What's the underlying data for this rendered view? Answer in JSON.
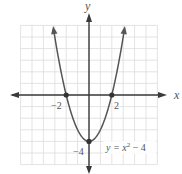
{
  "chart_data": {
    "type": "line",
    "title": "",
    "equation_label": "y = x² − 4",
    "equation_parts": {
      "lhs": "y = x",
      "exp": "2",
      "rhs": " − 4"
    },
    "xlabel": "x",
    "ylabel": "y",
    "xlim": [
      -6,
      6
    ],
    "ylim": [
      -6,
      6
    ],
    "grid": true,
    "grid_step": 1,
    "series": [
      {
        "name": "y = x^2 - 4",
        "function": "x^2 - 4",
        "x": [
          -3.16,
          -3,
          -2.5,
          -2,
          -1.5,
          -1,
          -0.5,
          0,
          0.5,
          1,
          1.5,
          2,
          2.5,
          3,
          3.16
        ],
        "y": [
          6,
          5,
          2.25,
          0,
          -1.75,
          -3,
          -3.75,
          -4,
          -3.75,
          -3,
          -1.75,
          0,
          2.25,
          5,
          6
        ]
      }
    ],
    "marked_points": [
      {
        "x": -2,
        "y": 0,
        "label": "−2"
      },
      {
        "x": 2,
        "y": 0,
        "label": "2"
      },
      {
        "x": 0,
        "y": -4,
        "label": "−4"
      }
    ],
    "colors": {
      "curve": "#555555",
      "axis": "#3a3a3a",
      "grid": "#dcdcdc",
      "label": "#555555"
    }
  },
  "labels": {
    "x_axis": "x",
    "y_axis": "y",
    "tick_neg2": "−2",
    "tick_pos2": "2",
    "tick_neg4": "−4",
    "eq_lhs": "y = x",
    "eq_exp": "2",
    "eq_rhs": " − 4"
  }
}
